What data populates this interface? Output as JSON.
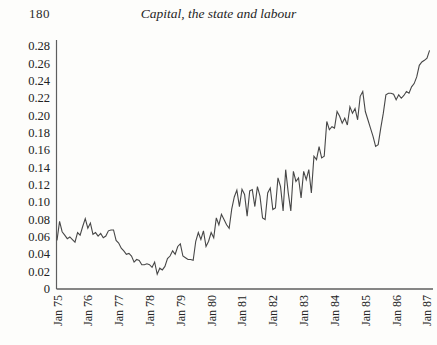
{
  "page": {
    "number": "180",
    "title": "Capital, the state and labour"
  },
  "chart_data": {
    "type": "line",
    "title": "",
    "xlabel": "",
    "ylabel": "",
    "frequency": "monthly",
    "x_start": "Jan 75",
    "x_end": "Feb 87",
    "x_tick_labels": [
      "Jan 75",
      "Jan 76",
      "Jan 77",
      "Jan 78",
      "Jan 79",
      "Jan 80",
      "Jan 81",
      "Jan 82",
      "Jan 83",
      "Jan 84",
      "Jan 85",
      "Jan 86",
      "Jan 87"
    ],
    "y_tick_labels": [
      "0.28",
      "0.26",
      "0.24",
      "0.22",
      "0.20",
      "0.18",
      "0.16",
      "0.14",
      "0.12",
      "0.10",
      "0.08",
      "0.06",
      "0.04",
      "0.02",
      "0"
    ],
    "ylim": [
      0,
      0.28
    ],
    "grid": "off",
    "legend": "none",
    "line_color": "#474747",
    "axis_color": "#5e5e5e",
    "series": [
      {
        "name": "series-1",
        "values": [
          0.056,
          0.078,
          0.066,
          0.062,
          0.058,
          0.06,
          0.057,
          0.054,
          0.065,
          0.062,
          0.072,
          0.081,
          0.07,
          0.076,
          0.063,
          0.065,
          0.061,
          0.064,
          0.059,
          0.061,
          0.067,
          0.068,
          0.068,
          0.056,
          0.053,
          0.047,
          0.044,
          0.04,
          0.041,
          0.038,
          0.031,
          0.034,
          0.033,
          0.028,
          0.028,
          0.029,
          0.028,
          0.025,
          0.031,
          0.017,
          0.024,
          0.022,
          0.026,
          0.035,
          0.038,
          0.044,
          0.04,
          0.049,
          0.052,
          0.038,
          0.036,
          0.034,
          0.034,
          0.033,
          0.055,
          0.065,
          0.057,
          0.067,
          0.049,
          0.055,
          0.065,
          0.059,
          0.082,
          0.074,
          0.086,
          0.08,
          0.074,
          0.07,
          0.092,
          0.106,
          0.114,
          0.095,
          0.115,
          0.109,
          0.084,
          0.113,
          0.1145,
          0.095,
          0.118,
          0.107,
          0.082,
          0.08,
          0.1107,
          0.1164,
          0.0916,
          0.0934,
          0.128,
          0.118,
          0.09,
          0.1375,
          0.1107,
          0.09,
          0.1356,
          0.124,
          0.128,
          0.105,
          0.1356,
          0.126,
          0.1375,
          0.1107,
          0.153,
          0.149,
          0.164,
          0.151,
          0.153,
          0.193,
          0.1835,
          0.187,
          0.1854,
          0.2045,
          0.199,
          0.191,
          0.1968,
          0.189,
          0.21,
          0.2026,
          0.208,
          0.195,
          0.222,
          0.2275,
          0.2045,
          0.195,
          0.1853,
          0.1758,
          0.1643,
          0.1663,
          0.1853,
          0.2026,
          0.2237,
          0.2256,
          0.2256,
          0.2244,
          0.218,
          0.2237,
          0.2198,
          0.223,
          0.2275,
          0.2256,
          0.2329,
          0.2367,
          0.2444,
          0.2577,
          0.2616,
          0.2635,
          0.266,
          0.275
        ]
      }
    ]
  }
}
